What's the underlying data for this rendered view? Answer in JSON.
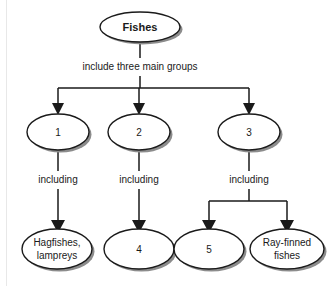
{
  "diagram": {
    "type": "concept-map",
    "title_node": {
      "id": "fishes",
      "label": "Fishes",
      "cx": 140,
      "cy": 27,
      "rx": 40,
      "ry": 15,
      "bold": true
    },
    "edge_labels": [
      {
        "id": "root-edge",
        "text": "include three main groups",
        "x": 140,
        "y": 67
      },
      {
        "id": "including-1",
        "text": "including",
        "x": 58,
        "y": 180
      },
      {
        "id": "including-2",
        "text": "including",
        "x": 139,
        "y": 180
      },
      {
        "id": "including-3",
        "text": "including",
        "x": 249,
        "y": 180
      }
    ],
    "group_nodes": [
      {
        "id": "group-1",
        "label": "1",
        "cx": 58,
        "cy": 132,
        "rx": 31,
        "ry": 18
      },
      {
        "id": "group-2",
        "label": "2",
        "cx": 139,
        "cy": 132,
        "rx": 31,
        "ry": 18
      },
      {
        "id": "group-3",
        "label": "3",
        "cx": 249,
        "cy": 132,
        "rx": 31,
        "ry": 18
      }
    ],
    "leaf_nodes": [
      {
        "id": "leaf-hagfishes",
        "label_line1": "Hagfishes,",
        "label_line2": "lampreys",
        "cx": 57,
        "cy": 249,
        "rx": 35,
        "ry": 20
      },
      {
        "id": "leaf-4",
        "label_line1": "4",
        "label_line2": "",
        "cx": 139,
        "cy": 249,
        "rx": 35,
        "ry": 20
      },
      {
        "id": "leaf-5",
        "label_line1": "5",
        "label_line2": "",
        "cx": 209,
        "cy": 249,
        "rx": 35,
        "ry": 20
      },
      {
        "id": "leaf-rayfinned",
        "label_line1": "Ray-finned",
        "label_line2": "fishes",
        "cx": 287,
        "cy": 249,
        "rx": 37,
        "ry": 20
      }
    ],
    "colors": {
      "stroke": "#1a1a1a",
      "shadow": "#8c8c8c",
      "fill": "#ffffff",
      "background": "#ffffff"
    }
  }
}
